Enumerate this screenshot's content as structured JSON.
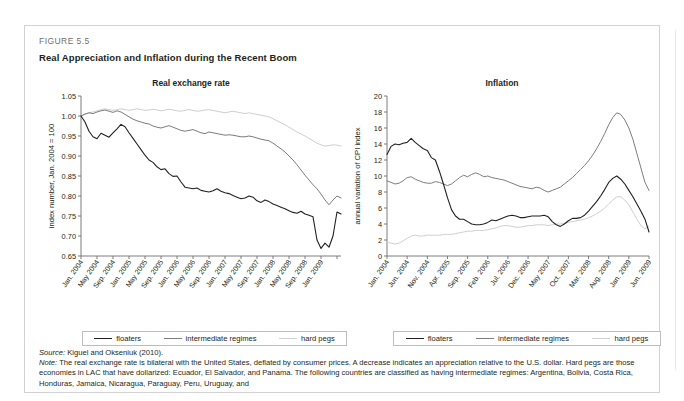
{
  "figure": {
    "label": "FIGURE 5.5",
    "title": "Real Appreciation and Inflation during the Recent Boom"
  },
  "legend": {
    "items": [
      {
        "label": "floaters",
        "color": "#231f20"
      },
      {
        "label": "intermediate regimes",
        "color": "#7d7d7d"
      },
      {
        "label": "hard pegs",
        "color": "#cfcfcf"
      }
    ]
  },
  "notes": {
    "source_label": "Source:",
    "source_text": " Kiguel and Okseniuk (2010).",
    "note_label": "Note:",
    "note_text": " The real exchange rate is bilateral with the United States, deflated by consumer prices. A decrease indicates an appreciation relative to the U.S. dollar. Hard pegs are those economies in LAC that have dollarized: Ecuador, El Salvador, and Panama. The following countries are classified as having intermediate regimes: Argentina, Bolivia, Costa Rica, Honduras, Jamaica, Nicaragua, Paraguay, Peru, Uruguay, and"
  },
  "chart_data": [
    {
      "type": "line",
      "title": "Real exchange rate",
      "xlabel": "",
      "ylabel": "index number, Jan. 2004 = 100",
      "ylim": [
        0.65,
        1.05
      ],
      "yticks": [
        0.65,
        0.7,
        0.75,
        0.8,
        0.85,
        0.9,
        0.95,
        1.0,
        1.05
      ],
      "ytick_labels": [
        "0.65",
        "0.70",
        "0.75",
        "0.80",
        "0.85",
        "0.90",
        "0.95",
        "1.00",
        "1.05"
      ],
      "grid": false,
      "legend_position": "bottom",
      "xtick_labels": [
        "Jan. 2004",
        "May 2004",
        "Sep. 2004",
        "Jan. 2005",
        "May 2005",
        "Sep. 2005",
        "Jan. 2006",
        "May 2006",
        "Sep. 2006",
        "Jan. 2007",
        "May 2007",
        "Sep. 2007",
        "Jan. 2008",
        "May 2008",
        "Sep. 2008",
        "Jan. 2009"
      ],
      "xtick_step_months": 4,
      "n_points": 66,
      "series": [
        {
          "name": "floaters",
          "color": "#231f20",
          "values": [
            1.0,
            0.985,
            0.962,
            0.948,
            0.943,
            0.957,
            0.952,
            0.947,
            0.958,
            0.968,
            0.979,
            0.973,
            0.958,
            0.944,
            0.93,
            0.916,
            0.902,
            0.89,
            0.884,
            0.873,
            0.866,
            0.868,
            0.856,
            0.849,
            0.85,
            0.835,
            0.822,
            0.82,
            0.818,
            0.82,
            0.814,
            0.812,
            0.81,
            0.813,
            0.818,
            0.812,
            0.808,
            0.806,
            0.801,
            0.797,
            0.793,
            0.795,
            0.8,
            0.797,
            0.788,
            0.784,
            0.79,
            0.786,
            0.78,
            0.776,
            0.772,
            0.768,
            0.763,
            0.759,
            0.757,
            0.762,
            0.755,
            0.752,
            0.748,
            0.69,
            0.669,
            0.682,
            0.672,
            0.7,
            0.76,
            0.755
          ]
        },
        {
          "name": "intermediate regimes",
          "color": "#7d7d7d",
          "values": [
            1.0,
            1.005,
            1.008,
            1.006,
            1.01,
            1.013,
            1.015,
            1.012,
            1.009,
            1.013,
            1.01,
            1.004,
            0.998,
            0.992,
            0.988,
            0.985,
            0.982,
            0.98,
            0.975,
            0.972,
            0.97,
            0.973,
            0.976,
            0.972,
            0.968,
            0.964,
            0.962,
            0.964,
            0.966,
            0.962,
            0.958,
            0.956,
            0.96,
            0.958,
            0.956,
            0.954,
            0.952,
            0.953,
            0.952,
            0.95,
            0.948,
            0.948,
            0.95,
            0.948,
            0.945,
            0.942,
            0.94,
            0.938,
            0.932,
            0.925,
            0.918,
            0.91,
            0.9,
            0.89,
            0.878,
            0.865,
            0.852,
            0.84,
            0.828,
            0.818,
            0.805,
            0.79,
            0.778,
            0.79,
            0.8,
            0.795
          ]
        },
        {
          "name": "hard pegs",
          "color": "#cfcfcf",
          "values": [
            1.0,
            1.004,
            1.008,
            1.01,
            1.013,
            1.016,
            1.018,
            1.016,
            1.014,
            1.016,
            1.018,
            1.016,
            1.014,
            1.016,
            1.018,
            1.016,
            1.014,
            1.015,
            1.017,
            1.015,
            1.013,
            1.015,
            1.017,
            1.015,
            1.013,
            1.012,
            1.014,
            1.016,
            1.014,
            1.012,
            1.013,
            1.015,
            1.016,
            1.014,
            1.012,
            1.01,
            1.008,
            1.01,
            1.012,
            1.01,
            1.008,
            1.006,
            1.008,
            1.006,
            1.004,
            1.002,
            1.0,
            0.998,
            0.993,
            0.988,
            0.983,
            0.978,
            0.972,
            0.966,
            0.96,
            0.955,
            0.95,
            0.944,
            0.938,
            0.932,
            0.928,
            0.925,
            0.926,
            0.928,
            0.927,
            0.925
          ]
        }
      ]
    },
    {
      "type": "line",
      "title": "Inflation",
      "xlabel": "",
      "ylabel": "annual variation of CPI index",
      "ylim": [
        0,
        20
      ],
      "yticks": [
        0,
        2,
        4,
        6,
        8,
        10,
        12,
        14,
        16,
        18,
        20
      ],
      "ytick_labels": [
        "0",
        "2",
        "4",
        "6",
        "8",
        "10",
        "12",
        "14",
        "16",
        "18",
        "20"
      ],
      "grid": false,
      "legend_position": "bottom",
      "xtick_labels": [
        "Jan. 2004",
        "Jun. 2004",
        "Nov. 2004",
        "Apr. 2005",
        "Sep. 2005",
        "Feb. 2006",
        "Jul. 2006",
        "Dec. 2006",
        "May 2007",
        "Oct. 2007",
        "Mar. 2008",
        "Aug. 2008",
        "Jan. 2009",
        "Jun. 2009"
      ],
      "xtick_step_months": 5,
      "n_points": 66,
      "series": [
        {
          "name": "floaters",
          "color": "#231f20",
          "values": [
            12.7,
            13.7,
            14.0,
            13.9,
            14.1,
            14.2,
            14.7,
            14.2,
            13.8,
            13.4,
            13.2,
            12.3,
            12.0,
            10.6,
            9.0,
            7.3,
            5.8,
            5.0,
            4.6,
            4.6,
            4.3,
            4.0,
            3.9,
            3.9,
            4.0,
            4.2,
            4.5,
            4.4,
            4.6,
            4.8,
            5.0,
            5.1,
            5.0,
            4.8,
            4.8,
            4.9,
            5.0,
            5.0,
            5.0,
            5.1,
            4.9,
            4.3,
            3.9,
            3.7,
            4.0,
            4.4,
            4.7,
            4.7,
            4.8,
            5.1,
            5.6,
            6.2,
            6.8,
            7.5,
            8.3,
            9.2,
            9.7,
            10.0,
            9.6,
            9.0,
            8.2,
            7.4,
            6.5,
            5.6,
            4.6,
            3.0
          ]
        },
        {
          "name": "intermediate regimes",
          "color": "#7d7d7d",
          "values": [
            9.4,
            9.2,
            9.0,
            9.1,
            9.4,
            9.8,
            9.9,
            9.6,
            9.4,
            9.2,
            9.1,
            9.1,
            9.3,
            9.2,
            9.0,
            8.8,
            9.0,
            9.4,
            9.8,
            10.1,
            9.9,
            10.2,
            10.4,
            10.2,
            9.9,
            10.0,
            9.8,
            9.7,
            9.6,
            9.5,
            9.3,
            9.1,
            8.9,
            8.7,
            8.6,
            8.5,
            8.4,
            8.6,
            8.5,
            8.2,
            8.0,
            8.2,
            8.4,
            8.6,
            9.0,
            9.4,
            9.8,
            10.3,
            10.8,
            11.3,
            11.9,
            12.6,
            13.4,
            14.3,
            15.3,
            16.4,
            17.3,
            17.9,
            17.7,
            17.0,
            16.0,
            14.6,
            12.8,
            11.0,
            9.2,
            8.2
          ]
        },
        {
          "name": "hard pegs",
          "color": "#cfcfcf",
          "values": [
            1.8,
            1.6,
            1.5,
            1.6,
            1.9,
            2.2,
            2.5,
            2.6,
            2.5,
            2.5,
            2.6,
            2.6,
            2.6,
            2.6,
            2.7,
            2.7,
            2.7,
            2.8,
            2.9,
            3.0,
            3.1,
            3.1,
            3.2,
            3.2,
            3.2,
            3.3,
            3.4,
            3.5,
            3.7,
            3.8,
            3.8,
            3.7,
            3.6,
            3.6,
            3.7,
            3.8,
            3.8,
            3.9,
            3.9,
            3.9,
            3.8,
            3.9,
            4.0,
            4.0,
            4.1,
            4.2,
            4.3,
            4.4,
            4.5,
            4.6,
            4.8,
            5.0,
            5.3,
            5.6,
            6.0,
            6.5,
            7.0,
            7.4,
            7.4,
            7.0,
            6.4,
            5.5,
            4.6,
            3.8,
            3.4,
            3.7
          ]
        }
      ]
    }
  ]
}
